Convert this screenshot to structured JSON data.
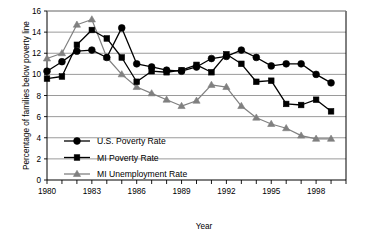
{
  "chart_data": {
    "type": "line",
    "title": "",
    "xlabel": "Year",
    "ylabel": "Percentage of families below poverty line",
    "xlim": [
      1980,
      1999
    ],
    "ylim": [
      0,
      16
    ],
    "ytick_step": 2,
    "yticks": [
      "0",
      "2",
      "4",
      "6",
      "8",
      "10",
      "12",
      "14",
      "16"
    ],
    "xticks_labeled": [
      "1980",
      "1983",
      "1986",
      "1989",
      "1992",
      "1995",
      "1998"
    ],
    "x": [
      1980,
      1981,
      1982,
      1983,
      1984,
      1985,
      1986,
      1987,
      1988,
      1989,
      1990,
      1991,
      1992,
      1993,
      1994,
      1995,
      1996,
      1997,
      1998,
      1999
    ],
    "grid": "horizontal",
    "legend_position": "inside-lower-left",
    "series": [
      {
        "name": "U.S. Poverty Rate",
        "marker": "circle",
        "color": "#000000",
        "values": [
          10.3,
          11.2,
          12.2,
          12.3,
          11.6,
          14.4,
          11.0,
          10.7,
          10.4,
          10.3,
          10.7,
          11.5,
          11.7,
          12.3,
          11.6,
          10.8,
          11.0,
          11.0,
          10.0,
          9.2
        ]
      },
      {
        "name": "MI Poverty Rate",
        "marker": "square",
        "color": "#000000",
        "values": [
          9.6,
          9.8,
          12.8,
          14.2,
          13.4,
          11.6,
          9.3,
          10.3,
          10.2,
          10.4,
          10.9,
          10.2,
          11.9,
          11.0,
          9.3,
          9.4,
          7.2,
          7.1,
          7.6,
          6.5
        ]
      },
      {
        "name": "MI Unemployment Rate",
        "marker": "triangle",
        "color": "#808080",
        "values": [
          11.5,
          12.0,
          14.7,
          15.2,
          11.6,
          10.0,
          8.8,
          8.2,
          7.6,
          7.0,
          7.5,
          9.0,
          8.8,
          7.0,
          5.9,
          5.3,
          4.9,
          4.2,
          3.9,
          3.9
        ]
      }
    ]
  },
  "legend": {
    "items": [
      {
        "label": "U.S. Poverty Rate",
        "marker": "circle",
        "color": "#000000"
      },
      {
        "label": "MI Poverty Rate",
        "marker": "square",
        "color": "#000000"
      },
      {
        "label": "MI Unemployment Rate",
        "marker": "triangle",
        "color": "#808080"
      }
    ]
  },
  "axes": {
    "x_title": "Year",
    "y_title": "Percentage of families below poverty line"
  }
}
